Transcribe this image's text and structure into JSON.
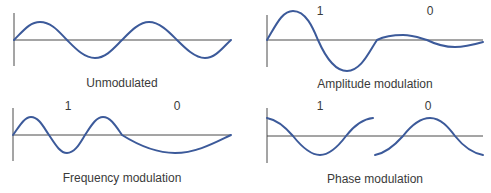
{
  "colors": {
    "wave": "#3c5a9a",
    "axis": "#4a4a4a",
    "text": "#3a3a3a",
    "background": "#ffffff"
  },
  "panels": [
    {
      "id": "unmodulated",
      "caption": "Unmodulated",
      "bits": []
    },
    {
      "id": "amplitude",
      "caption": "Amplitude modulation",
      "bits": [
        "1",
        "0"
      ]
    },
    {
      "id": "frequency",
      "caption": "Frequency modulation",
      "bits": [
        "1",
        "0"
      ]
    },
    {
      "id": "phase",
      "caption": "Phase modulation",
      "bits": [
        "1",
        "0"
      ]
    }
  ]
}
